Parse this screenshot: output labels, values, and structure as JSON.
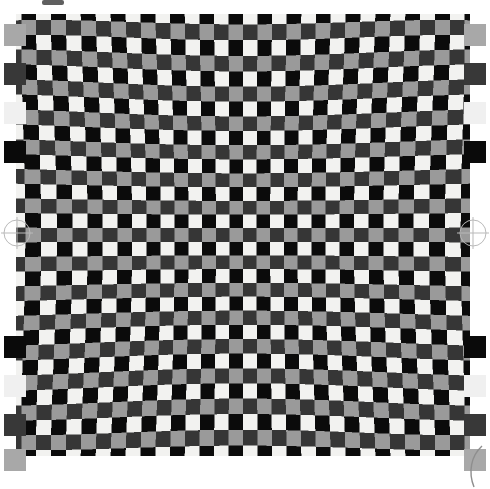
{
  "document": {
    "title": "Distorted Checkerboard Calibration Chart",
    "kind": "camera-lens-distortion-test-target",
    "width": 490,
    "height": 477,
    "background_color": "#ffffff"
  },
  "target": {
    "name": "checkerboard",
    "description": "Barrel/pincushion distorted four-tone checkerboard",
    "bounds": {
      "x": 26,
      "y": 24,
      "width": 434,
      "height": 422
    },
    "cell_size_px": 13.6,
    "columns": 32,
    "rows": 31,
    "distortion": {
      "model": "radial-barrel",
      "k1": -0.085,
      "k2": 0.022,
      "center_x": 0.5,
      "center_y": 0.5
    },
    "tones": {
      "white": "#f2f2f0",
      "black": "#0b0b0b",
      "light_gray": "#9a9a9a",
      "dark_gray": "#363636"
    },
    "tone_order_note": "Rows alternate between a black/white pair and a light-gray/dark-gray pair"
  },
  "left_patches": {
    "name": "grayscale-step-wedge-left",
    "x": 4,
    "items": [
      {
        "label": "gray-50",
        "color": "#a8a8a8",
        "y": 24
      },
      {
        "label": "gray-22",
        "color": "#383838",
        "y": 63
      },
      {
        "label": "gray-95",
        "color": "#f0f0f0",
        "y": 102
      },
      {
        "label": "gray-04",
        "color": "#0a0a0a",
        "y": 141
      },
      {
        "label": "gray-04",
        "color": "#0a0a0a",
        "y": 336
      },
      {
        "label": "gray-95",
        "color": "#f0f0f0",
        "y": 375
      },
      {
        "label": "gray-22",
        "color": "#383838",
        "y": 414
      },
      {
        "label": "gray-50",
        "color": "#a8a8a8",
        "y": 449
      }
    ]
  },
  "right_patches": {
    "name": "grayscale-step-wedge-right",
    "x": 464,
    "items": [
      {
        "label": "gray-50",
        "color": "#a8a8a8",
        "y": 24
      },
      {
        "label": "gray-22",
        "color": "#383838",
        "y": 63
      },
      {
        "label": "gray-95",
        "color": "#f0f0f0",
        "y": 102
      },
      {
        "label": "gray-04",
        "color": "#0a0a0a",
        "y": 141
      },
      {
        "label": "gray-04",
        "color": "#0a0a0a",
        "y": 336
      },
      {
        "label": "gray-95",
        "color": "#f0f0f0",
        "y": 375
      },
      {
        "label": "gray-22",
        "color": "#383838",
        "y": 414
      },
      {
        "label": "gray-50",
        "color": "#a8a8a8",
        "y": 449
      }
    ]
  },
  "registration_marks": [
    {
      "name": "registration-mark-left",
      "x": 0,
      "y": 216,
      "radius": 13,
      "color": "#b9b9b9"
    },
    {
      "name": "registration-mark-right",
      "x": 456,
      "y": 216,
      "radius": 13,
      "color": "#b9b9b9"
    }
  ],
  "corner_arc": {
    "name": "corner-arc-bottom-right",
    "x": 470,
    "y": 450,
    "radius": 26,
    "color": "#8e8e8e"
  },
  "top_mark": {
    "name": "top-edge-artifact",
    "x": 42,
    "y": 0,
    "width": 22,
    "height": 5,
    "color": "#2a2a2a"
  }
}
